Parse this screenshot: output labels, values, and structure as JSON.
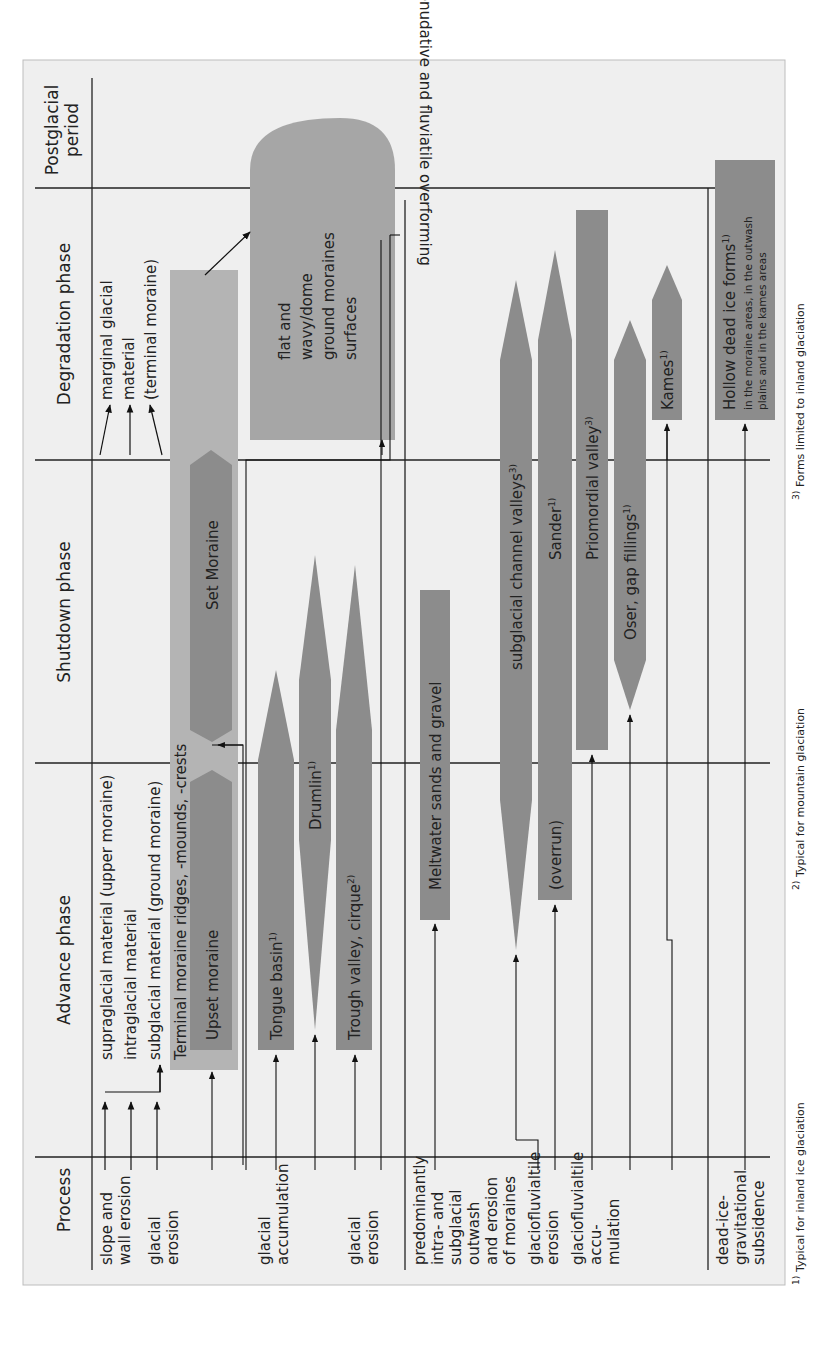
{
  "header": {
    "process": "Process",
    "advance": "Advance phase",
    "shutdown": "Shutdown phase",
    "degradation": "Degradation phase",
    "postglacial_1": "Postglacial",
    "postglacial_2": "period"
  },
  "rows": {
    "glacial": {
      "category": [
        "Glacial",
        "(and",
        "dead-ice",
        "gravita-",
        "tional)",
        "forms",
        "and",
        "correlate",
        "sediments"
      ],
      "processes": {
        "slope": [
          "slope and",
          "wall erosion"
        ],
        "glacial_erosion_top": [
          "glacial",
          "erosion"
        ],
        "accumulation": [
          "glacial",
          "accumulation"
        ],
        "glacial_erosion_bottom": [
          "glacial",
          "erosion"
        ]
      },
      "materials": {
        "supraglacial": "supraglacial material (upper moraine)",
        "intraglacial": "intraglacial material",
        "subglacial": "subglacial material (ground moraine)",
        "marginal": [
          "marginal glacial",
          "material",
          "(terminal moraine)"
        ]
      },
      "forms": {
        "terminal_moraine": "Terminal moraine ridges, -mounds, -crests",
        "upset_moraine": "Upset moraine",
        "set_moraine": "Set Moraine",
        "tongue_basin": "Tongue basin",
        "tongue_basin_sup": "1)",
        "drumlin": "Drumlin",
        "drumlin_sup": "1)",
        "trough_valley": "Trough valley, cirque",
        "trough_valley_sup": "2)",
        "ground_moraine": [
          "flat and",
          "wavy/dome",
          "ground moraines",
          "surfaces"
        ],
        "ground_moraine_sup": "1)"
      }
    },
    "glacifluviatile": {
      "category": [
        "Glaci-",
        "fluviatile",
        "(and",
        "dead-ice",
        "gravita-",
        "tional)",
        "forms",
        "and",
        "correlate",
        "sediments"
      ],
      "processes": {
        "outwash": [
          "predominantly",
          "intra- and",
          "subglacial",
          "outwash",
          "and erosion",
          "of moraines"
        ],
        "erosion": [
          "glaciofluvialtile",
          "erosion"
        ],
        "accumulation": [
          "glaciofluvialtile",
          "accu-",
          "mulation"
        ]
      },
      "forms": {
        "meltwater": "Meltwater sands and gravel",
        "channel_valleys": "subglacial channel valleys",
        "channel_valleys_sup": "3)",
        "sander": "Sander",
        "sander_sup": "1)",
        "overrun": "(overrun)",
        "priomordial": "Priomordial valley",
        "priomordial_sup": "3)",
        "oser": "Oser, gap fillings",
        "oser_sup": "1)",
        "kames": "Kames",
        "kames_sup": "1)"
      }
    },
    "dead_ice": {
      "category": [
        "Dead ice",
        "forms"
      ],
      "process": [
        "dead-ice-",
        "gravitational",
        "subsidence"
      ],
      "forms": {
        "hollow": "Hollow dead ice forms",
        "hollow_sup": "1)",
        "hollow_note_1": "in the moraine areas, in the outwash",
        "hollow_note_2": "plains and in the kames areas"
      }
    }
  },
  "postglacial_text": "denudative and fluviatile overforming",
  "footnotes": {
    "f1": "Typical for inland ice glaciation",
    "f1_mark": "1)",
    "f2": "Typical for mountain glaciation",
    "f2_mark": "2)",
    "f3": "Forms limited to inland glaciation",
    "f3_mark": "3)"
  },
  "colors": {
    "background": "#efefef",
    "light_shape": "#b4b4b4",
    "mid_shape": "#999999",
    "dark_shape": "#8c8c8c",
    "line": "#222222"
  }
}
